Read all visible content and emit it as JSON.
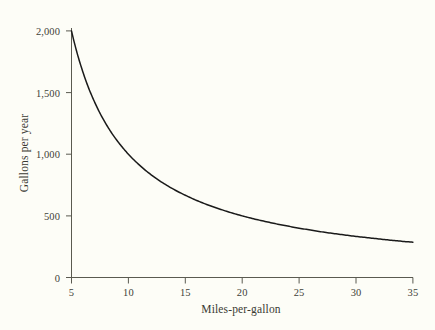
{
  "chart_data": {
    "type": "line",
    "title": "",
    "subtitle": "",
    "xlabel": "Miles-per-gallon",
    "ylabel": "Gallons per year",
    "xlim": [
      5,
      35
    ],
    "ylim": [
      0,
      2000
    ],
    "xticks": [
      5,
      10,
      15,
      20,
      25,
      30,
      35
    ],
    "yticks": [
      0,
      500,
      1000,
      1500,
      2000
    ],
    "xtick_labels": [
      "5",
      "10",
      "15",
      "20",
      "25",
      "30",
      "35"
    ],
    "ytick_labels": [
      "0",
      "500",
      "1,000",
      "1,500",
      "2,000"
    ],
    "grid": false,
    "legend": null,
    "relationship": "gallons = 10000 / mpg (10,000 miles driven per year)",
    "series": [
      {
        "name": "Gallons per year",
        "color": "#1a1a1a",
        "x": [
          5,
          5.5,
          6,
          6.5,
          7,
          7.5,
          8,
          8.5,
          9,
          9.5,
          10,
          11,
          12,
          13,
          14,
          15,
          16,
          17,
          18,
          19,
          20,
          21,
          22,
          23,
          24,
          25,
          26,
          27,
          28,
          29,
          30,
          31,
          32,
          33,
          34,
          35
        ],
        "values": [
          2000,
          1818,
          1667,
          1538,
          1429,
          1333,
          1250,
          1176,
          1111,
          1053,
          1000,
          909,
          833,
          769,
          714,
          667,
          625,
          588,
          556,
          526,
          500,
          476,
          455,
          435,
          417,
          400,
          385,
          370,
          357,
          345,
          333,
          323,
          313,
          303,
          294,
          286
        ]
      }
    ]
  },
  "axes": {
    "x_title": "Miles-per-gallon",
    "y_title": "Gallons per year",
    "x_tick_labels": [
      "5",
      "10",
      "15",
      "20",
      "25",
      "30",
      "35"
    ],
    "y_tick_labels": [
      "0",
      "500",
      "1,000",
      "1,500",
      "2,000"
    ]
  },
  "style": {
    "background_color": "#fdfdf7",
    "axis_color": "#5a5a50",
    "curve_color": "#1a1a1a",
    "text_color": "#3a3a33"
  }
}
